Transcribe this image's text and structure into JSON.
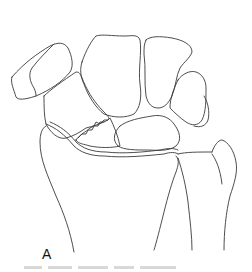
{
  "figure": {
    "panel_label": "A",
    "stroke_color": "#3a3a3a",
    "background_color": "#ffffff"
  },
  "caption": {
    "visible_text": ""
  }
}
